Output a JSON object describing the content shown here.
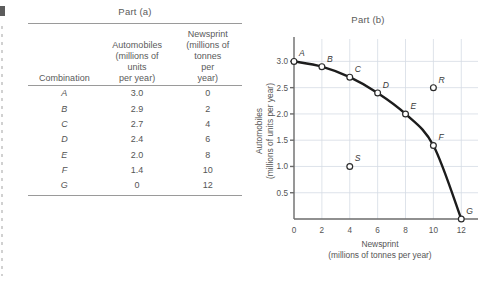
{
  "part_a": {
    "title": "Part (a)",
    "table": {
      "headers": [
        {
          "lines": [
            "Combination"
          ]
        },
        {
          "lines": [
            "Automobiles",
            "(millions of",
            "units",
            "per year)"
          ]
        },
        {
          "lines": [
            "Newsprint",
            "(millions of",
            "tonnes",
            "per",
            "year)"
          ]
        }
      ],
      "rows": [
        {
          "combination": "A",
          "automobiles": "3.0",
          "newsprint": "0"
        },
        {
          "combination": "B",
          "automobiles": "2.9",
          "newsprint": "2"
        },
        {
          "combination": "C",
          "automobiles": "2.7",
          "newsprint": "4"
        },
        {
          "combination": "D",
          "automobiles": "2.4",
          "newsprint": "6"
        },
        {
          "combination": "E",
          "automobiles": "2.0",
          "newsprint": "8"
        },
        {
          "combination": "F",
          "automobiles": "1.4",
          "newsprint": "10"
        },
        {
          "combination": "G",
          "automobiles": "0",
          "newsprint": "12"
        }
      ]
    }
  },
  "part_b": {
    "title": "Part (b)"
  },
  "chart_data": {
    "type": "line",
    "title": "Part (b)",
    "xlabel": "Newsprint",
    "xlabel_sub": "(millions of tonnes per year)",
    "ylabel": "Automobiles",
    "ylabel_sub": "(millions of units per year)",
    "xlim": [
      0,
      13.2
    ],
    "ylim": [
      0,
      3.35
    ],
    "xticks": [
      0,
      2,
      4,
      6,
      8,
      10,
      12
    ],
    "xtick_labels": [
      "0",
      "2",
      "4",
      "6",
      "8",
      "10",
      "12"
    ],
    "yticks": [
      0.5,
      1.0,
      1.5,
      2.0,
      2.5,
      3.0
    ],
    "ytick_labels": [
      "0.5",
      "1.0",
      "1.5",
      "2.0",
      "2.5",
      "3.0"
    ],
    "grid": true,
    "legend": "none",
    "series": [
      {
        "name": "Production possibilities frontier",
        "label_position": "point",
        "points": [
          {
            "label": "A",
            "x": 0,
            "y": 3.0,
            "label_dx": 5,
            "label_dy": -5,
            "on_frontier": true
          },
          {
            "label": "B",
            "x": 2,
            "y": 2.9,
            "label_dx": 5,
            "label_dy": -5,
            "on_frontier": true
          },
          {
            "label": "C",
            "x": 4,
            "y": 2.7,
            "label_dx": 5,
            "label_dy": -5,
            "on_frontier": true
          },
          {
            "label": "D",
            "x": 6,
            "y": 2.4,
            "label_dx": 5,
            "label_dy": -5,
            "on_frontier": true
          },
          {
            "label": "E",
            "x": 8,
            "y": 2.0,
            "label_dx": 5,
            "label_dy": -5,
            "on_frontier": true
          },
          {
            "label": "F",
            "x": 10,
            "y": 1.4,
            "label_dx": 5,
            "label_dy": -5,
            "on_frontier": true
          },
          {
            "label": "G",
            "x": 12,
            "y": 0.0,
            "label_dx": 5,
            "label_dy": -5,
            "on_frontier": true
          }
        ]
      }
    ],
    "extra_points": [
      {
        "label": "R",
        "x": 10,
        "y": 2.5,
        "label_dx": 5,
        "label_dy": -5,
        "region": "unattainable"
      },
      {
        "label": "S",
        "x": 4,
        "y": 1.0,
        "label_dx": 5,
        "label_dy": -5,
        "region": "inefficient"
      }
    ]
  }
}
